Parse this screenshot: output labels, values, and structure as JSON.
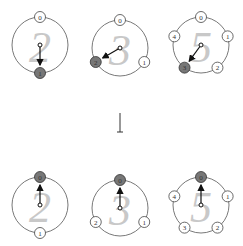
{
  "diagram": {
    "top_row": [
      {
        "count": "2",
        "cx": 40,
        "cy": 45,
        "r": 28,
        "nodes": [
          {
            "label": "0",
            "angle": -90,
            "active": false
          },
          {
            "label": "1",
            "angle": 90,
            "active": true
          }
        ],
        "hand_angle": 90
      },
      {
        "count": "3",
        "cx": 120,
        "cy": 48,
        "r": 28,
        "nodes": [
          {
            "label": "0",
            "angle": -90,
            "active": false
          },
          {
            "label": "1",
            "angle": 30,
            "active": false
          },
          {
            "label": "2",
            "angle": 150,
            "active": true
          }
        ],
        "hand_angle": 150
      },
      {
        "count": "5",
        "cx": 201,
        "cy": 45,
        "r": 28,
        "nodes": [
          {
            "label": "0",
            "angle": -90,
            "active": false
          },
          {
            "label": "1",
            "angle": -18,
            "active": false
          },
          {
            "label": "2",
            "angle": 54,
            "active": false
          },
          {
            "label": "3",
            "angle": 126,
            "active": true
          },
          {
            "label": "4",
            "angle": 198,
            "active": false
          }
        ],
        "hand_angle": 126
      }
    ],
    "bottom_row": [
      {
        "count": "2",
        "cx": 40,
        "cy": 205,
        "r": 28,
        "nodes": [
          {
            "label": "0",
            "angle": -90,
            "active": true
          },
          {
            "label": "1",
            "angle": 90,
            "active": false
          }
        ],
        "hand_angle": -90
      },
      {
        "count": "3",
        "cx": 120,
        "cy": 208,
        "r": 28,
        "nodes": [
          {
            "label": "0",
            "angle": -90,
            "active": true
          },
          {
            "label": "1",
            "angle": 30,
            "active": false
          },
          {
            "label": "2",
            "angle": 150,
            "active": false
          }
        ],
        "hand_angle": -90
      },
      {
        "count": "5",
        "cx": 201,
        "cy": 205,
        "r": 28,
        "nodes": [
          {
            "label": "0",
            "angle": -90,
            "active": true
          },
          {
            "label": "1",
            "angle": -18,
            "active": false
          },
          {
            "label": "2",
            "angle": 54,
            "active": false
          },
          {
            "label": "3",
            "angle": 126,
            "active": false
          },
          {
            "label": "4",
            "angle": 198,
            "active": false
          }
        ],
        "hand_angle": -90
      }
    ],
    "transition_arrow": {
      "x": 120,
      "y1": 113,
      "y2": 132
    }
  }
}
